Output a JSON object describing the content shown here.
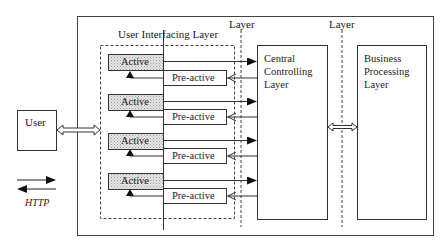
{
  "diagram": {
    "type": "layered-architecture",
    "user": {
      "label": "User"
    },
    "legend": {
      "label": "HTTP",
      "description": "paired request/response arrows"
    },
    "layers": {
      "user_interfacing": {
        "label": "User Interfacing Layer"
      },
      "divider_1_label": "Layer",
      "divider_2_label": "Layer",
      "central": {
        "label": "Central\nControlling\nLayer"
      },
      "business": {
        "label": "Business\nProcessing\nLayer"
      }
    },
    "component_pairs": [
      {
        "active": "Active",
        "preactive": "Pre-active"
      },
      {
        "active": "Active",
        "preactive": "Pre-active"
      },
      {
        "active": "Active",
        "preactive": "Pre-active"
      },
      {
        "active": "Active",
        "preactive": "Pre-active"
      }
    ],
    "colors": {
      "stroke": "#333333",
      "active_fill": "#d9d9d9",
      "background": "#ffffff"
    }
  }
}
